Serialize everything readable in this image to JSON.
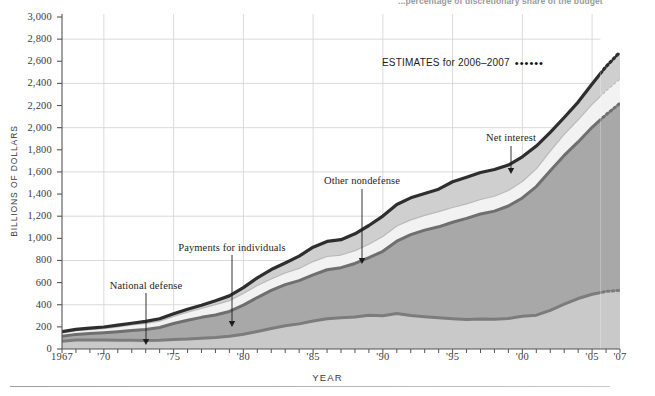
{
  "top_caption": "...percentage of discretionary share of the budget",
  "axes": {
    "y_title": "BILLIONS OF DOLLARS",
    "x_title": "YEAR",
    "y_ticks": [
      "0",
      "200",
      "400",
      "600",
      "800",
      "1,000",
      "1,200",
      "1,400",
      "1,600",
      "1,800",
      "2,000",
      "2,200",
      "2,400",
      "2,600",
      "2,800",
      "3,000"
    ],
    "x_ticks": [
      "1967",
      "'70",
      "'75",
      "'80",
      "'85",
      "'90",
      "'95",
      "'00",
      "'05",
      "'07"
    ]
  },
  "legend": {
    "estimates_label": "ESTIMATES for 2006–2007",
    "estimates_dots": "••••••"
  },
  "annotations": [
    {
      "id": "national-defense",
      "label": "National defense"
    },
    {
      "id": "payments-for-individuals",
      "label": "Payments for individuals"
    },
    {
      "id": "other-nondefense",
      "label": "Other nondefense"
    },
    {
      "id": "net-interest",
      "label": "Net interest"
    }
  ],
  "colors": {
    "national_defense": "#c9c9c9",
    "payments_for_individuals": "#a8a8a8",
    "other_nondefense": "#f2f2f2",
    "net_interest": "#cfcfcf",
    "total_outline": "#2e2e2e",
    "defense_outline": "#7c7c7c",
    "payments_outline": "#6f6f6f",
    "grid": "#d6d6d6",
    "axis": "#555555"
  },
  "chart_data": {
    "type": "area",
    "stacked": true,
    "xlabel": "YEAR",
    "ylabel": "BILLIONS OF DOLLARS",
    "xlim": [
      1967,
      2007
    ],
    "ylim": [
      0,
      3000
    ],
    "grid": true,
    "legend_position": "annotations-inline",
    "estimates_from": 2006,
    "estimates_to": 2007,
    "x": [
      1967,
      1968,
      1969,
      1970,
      1971,
      1972,
      1973,
      1974,
      1975,
      1976,
      1977,
      1978,
      1979,
      1980,
      1981,
      1982,
      1983,
      1984,
      1985,
      1986,
      1987,
      1988,
      1989,
      1990,
      1991,
      1992,
      1993,
      1994,
      1995,
      1996,
      1997,
      1998,
      1999,
      2000,
      2001,
      2002,
      2003,
      2004,
      2005,
      2006,
      2007
    ],
    "series": [
      {
        "name": "National defense",
        "color": "#c9c9c9",
        "values": [
          71,
          82,
          82,
          82,
          79,
          79,
          77,
          79,
          86,
          90,
          97,
          104,
          116,
          134,
          158,
          185,
          210,
          227,
          253,
          273,
          282,
          290,
          304,
          300,
          320,
          302,
          292,
          282,
          274,
          266,
          271,
          269,
          275,
          295,
          306,
          349,
          405,
          456,
          495,
          520,
          530
        ]
      },
      {
        "name": "Payments for individuals",
        "color": "#a8a8a8",
        "values": [
          43,
          50,
          57,
          65,
          77,
          88,
          100,
          115,
          145,
          170,
          189,
          203,
          223,
          263,
          307,
          344,
          372,
          391,
          416,
          443,
          453,
          483,
          521,
          583,
          654,
          731,
          782,
          822,
          871,
          914,
          949,
          977,
          1017,
          1070,
          1162,
          1262,
          1344,
          1415,
          1508,
          1597,
          1690
        ]
      },
      {
        "name": "Other nondefense",
        "color": "#f2f2f2",
        "values": [
          31,
          34,
          36,
          38,
          44,
          50,
          55,
          58,
          64,
          72,
          80,
          94,
          98,
          105,
          109,
          104,
          105,
          110,
          121,
          120,
          114,
          116,
          122,
          134,
          137,
          134,
          133,
          137,
          134,
          131,
          131,
          134,
          140,
          149,
          160,
          176,
          190,
          200,
          208,
          215,
          220
        ]
      },
      {
        "name": "Net interest",
        "color": "#cfcfcf",
        "values": [
          11,
          12,
          13,
          14,
          15,
          16,
          17,
          21,
          23,
          27,
          30,
          35,
          43,
          53,
          69,
          85,
          90,
          111,
          130,
          136,
          139,
          152,
          169,
          184,
          195,
          199,
          199,
          203,
          232,
          241,
          244,
          242,
          230,
          223,
          206,
          171,
          153,
          160,
          184,
          220,
          243
        ]
      }
    ],
    "totals": [
      157,
      178,
      184,
      196,
      210,
      231,
      246,
      269,
      332,
      371,
      409,
      458,
      504,
      591,
      678,
      746,
      808,
      851,
      946,
      990,
      1004,
      1064,
      1143,
      1253,
      1324,
      1381,
      1409,
      1461,
      1516,
      1560,
      1601,
      1652,
      1702,
      1789,
      1863,
      1999,
      2160,
      2292,
      2472,
      2551,
      2730
    ]
  }
}
